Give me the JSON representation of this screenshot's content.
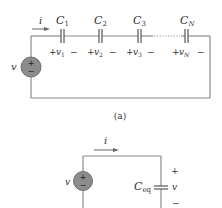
{
  "figure_a": {
    "caption": "(a)",
    "current_label": "i",
    "source_label": "v",
    "source_polarity": {
      "top": "+",
      "bottom": "−"
    },
    "capacitors": [
      {
        "name": "C",
        "sub": "1",
        "v": "v",
        "v_sub": "1",
        "plus": "+",
        "minus": "−"
      },
      {
        "name": "C",
        "sub": "2",
        "v": "v",
        "v_sub": "2",
        "plus": "+",
        "minus": "−"
      },
      {
        "name": "C",
        "sub": "3",
        "v": "v",
        "v_sub": "3",
        "plus": "+",
        "minus": "−"
      },
      {
        "name": "C",
        "sub": "N",
        "v": "v",
        "v_sub": "N",
        "plus": "+",
        "minus": "−"
      }
    ]
  },
  "figure_b": {
    "current_label": "i",
    "source_label": "v",
    "source_polarity": {
      "top": "+",
      "bottom": "−"
    },
    "capacitor": {
      "name": "C",
      "sub": "eq"
    },
    "voltage": {
      "plus": "+",
      "label": "v",
      "minus": "−"
    }
  },
  "colors": {
    "wire": "#8a8a8a",
    "source_fill": "#8c8c8c",
    "text": "#333333"
  }
}
